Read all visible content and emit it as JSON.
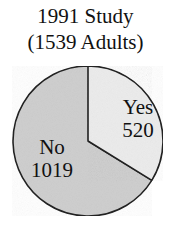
{
  "chart_data": {
    "type": "pie",
    "title": "1991 Study",
    "subtitle": "(1539 Adults)",
    "total": 1539,
    "slices": [
      {
        "label": "Yes",
        "value": 520,
        "color": "#ececec"
      },
      {
        "label": "No",
        "value": 1019,
        "color": "#cfcfcf"
      }
    ],
    "start_angle_deg": 0,
    "direction": "clockwise",
    "legend": "none (labels inside slices)"
  }
}
